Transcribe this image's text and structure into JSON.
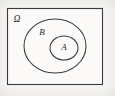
{
  "figure": {
    "type": "venn-diagram",
    "background_color": "#f7f6f4",
    "stroke_color": "#3a3a3a"
  },
  "universe": {
    "label": "Ω",
    "shape": "rectangle",
    "label_position": "top-left-inside",
    "bounds": {
      "x": 7,
      "y": 8,
      "width": 96,
      "height": 77
    }
  },
  "sets": [
    {
      "id": "B",
      "label": "B",
      "shape": "ellipse",
      "label_position": "upper-left-inside",
      "bounds": {
        "cx": 55,
        "cy": 46,
        "rx": 31,
        "ry": 27
      }
    },
    {
      "id": "A",
      "label": "A",
      "shape": "ellipse",
      "label_position": "center",
      "bounds": {
        "cx": 64,
        "cy": 48,
        "rx": 14,
        "ry": 12
      }
    }
  ],
  "relation": "A ⊆ B ⊆ Ω",
  "label_positions": {
    "omega": {
      "x": 17,
      "y": 20
    },
    "b": {
      "x": 42,
      "y": 33
    },
    "a": {
      "x": 64,
      "y": 48
    }
  }
}
